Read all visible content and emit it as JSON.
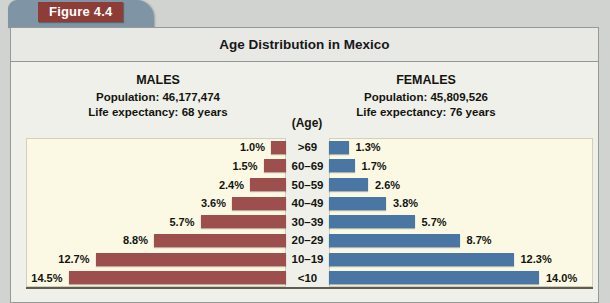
{
  "figure": {
    "label": "Figure 4.4"
  },
  "header": {
    "title": "Age Distribution in Mexico"
  },
  "males_panel": {
    "heading": "MALES",
    "population": "Population: 46,177,474",
    "life_expectancy": "Life expectancy: 68 years"
  },
  "females_panel": {
    "heading": "FEMALES",
    "population": "Population: 45,809,526",
    "life_expectancy": "Life expectancy: 76 years"
  },
  "age_axis": {
    "label": "(Age)"
  },
  "chart_data": {
    "type": "bar",
    "variant": "population-pyramid",
    "title": "Age Distribution in Mexico",
    "axis_label": "(Age)",
    "unit": "%",
    "categories": [
      ">69",
      "60–69",
      "50–59",
      "40–49",
      "30–39",
      "20–29",
      "10–19",
      "<10"
    ],
    "categories_order": "top-to-bottom",
    "series": [
      {
        "name": "Males",
        "side": "left",
        "color": "#9c4f4c",
        "values": [
          1.0,
          1.5,
          2.4,
          3.6,
          5.7,
          8.8,
          12.7,
          14.5
        ]
      },
      {
        "name": "Females",
        "side": "right",
        "color": "#4a76a4",
        "values": [
          1.3,
          1.7,
          2.6,
          3.8,
          5.7,
          8.7,
          12.3,
          14.0
        ]
      }
    ],
    "value_labels": {
      "males": [
        "1.0%",
        "1.5%",
        "2.4%",
        "3.6%",
        "5.7%",
        "8.8%",
        "12.7%",
        "14.5%"
      ],
      "females": [
        "1.3%",
        "1.7%",
        "2.6%",
        "3.8%",
        "5.7%",
        "8.7%",
        "12.3%",
        "14.0%"
      ]
    },
    "xlim_percent": [
      0,
      14.5
    ],
    "grid": false,
    "legend": false
  },
  "colors": {
    "male_bar": "#9c4f4c",
    "female_bar": "#4a76a4",
    "figure_tab": "#7f95a5",
    "figure_label_background": "#8e3c36",
    "plot_background": "#fbf9e4",
    "panel_background": "#eff0ea",
    "title_band_background": "#e8e9e4",
    "outer_background": "#d1d3d0"
  }
}
